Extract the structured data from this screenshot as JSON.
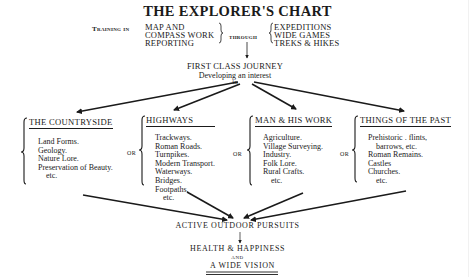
{
  "title": "THE EXPLORER'S CHART",
  "training": {
    "prefix": "Training in",
    "skills": [
      "MAP AND",
      "COMPASS WORK",
      "REPORTING"
    ],
    "connector": "through",
    "methods": [
      "EXPEDITIONS",
      "WIDE GAMES",
      "TREKS & HIKES"
    ]
  },
  "journey": {
    "title": "FIRST CLASS JOURNEY",
    "subtitle": "Developing an interest",
    "in": "in"
  },
  "connector_or": "OR",
  "categories": [
    {
      "heading": "THE COUNTRYSIDE",
      "items": [
        "Land Forms.",
        "Geology.",
        "Nature Lore.",
        "Preservation of Beauty.",
        "etc."
      ]
    },
    {
      "heading": "HIGHWAYS",
      "items": [
        "Trackways.",
        "Roman Roads.",
        "Turnpikes.",
        "Modern Transport.",
        "Waterways.",
        "Bridges.",
        "Footpaths.",
        "etc."
      ]
    },
    {
      "heading": "MAN & HIS WORK",
      "items": [
        "Agriculture.",
        "Village Surveying.",
        "Industry.",
        "Folk Lore.",
        "Rural Crafts.",
        "etc."
      ]
    },
    {
      "heading": "THINGS OF THE PAST",
      "items": [
        "Prehistoric . flints,",
        "barrows, etc.",
        "Roman Remains.",
        "Castles",
        "Churches.",
        "etc."
      ]
    }
  ],
  "outcome": {
    "pursuits": "ACTIVE OUTDOOR PURSUITS",
    "health": "HEALTH & HAPPINESS",
    "and": "AND",
    "vision": "A WIDE VISION"
  }
}
